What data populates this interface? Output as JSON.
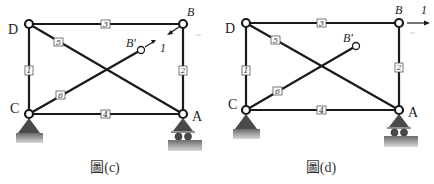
{
  "figures": [
    {
      "id": "c",
      "caption": "圖(c)",
      "joints": {
        "D": {
          "label": "D"
        },
        "B": {
          "label": "B"
        },
        "C": {
          "label": "C"
        },
        "A": {
          "label": "A"
        },
        "B_prime": {
          "label": "B'"
        }
      },
      "members": [
        {
          "number": "1",
          "from": "C",
          "to": "D"
        },
        {
          "number": "2",
          "from": "A",
          "to": "B"
        },
        {
          "number": "3",
          "from": "D",
          "to": "B"
        },
        {
          "number": "4",
          "from": "C",
          "to": "A"
        },
        {
          "number": "5",
          "from": "D",
          "to": "A"
        },
        {
          "number": "6",
          "from": "C",
          "to": "B'"
        }
      ],
      "loads": [
        {
          "label": "1",
          "description": "unit load pair along B'-B direction",
          "type": "diagonal-pair"
        }
      ],
      "supports": {
        "C": "pin",
        "A": "roller"
      }
    },
    {
      "id": "d",
      "caption": "圖(d)",
      "joints": {
        "D": {
          "label": "D"
        },
        "B": {
          "label": "B"
        },
        "C": {
          "label": "C"
        },
        "A": {
          "label": "A"
        },
        "B_prime": {
          "label": "B'"
        }
      },
      "members": [
        {
          "number": "1",
          "from": "C",
          "to": "D"
        },
        {
          "number": "2",
          "from": "A",
          "to": "B"
        },
        {
          "number": "3",
          "from": "D",
          "to": "B"
        },
        {
          "number": "4",
          "from": "C",
          "to": "A"
        },
        {
          "number": "5",
          "from": "D",
          "to": "A"
        },
        {
          "number": "6",
          "from": "C",
          "to": "B'"
        }
      ],
      "loads": [
        {
          "label": "1",
          "description": "unit horizontal load at B",
          "type": "horizontal-right"
        }
      ],
      "supports": {
        "C": "pin",
        "A": "roller"
      }
    }
  ]
}
